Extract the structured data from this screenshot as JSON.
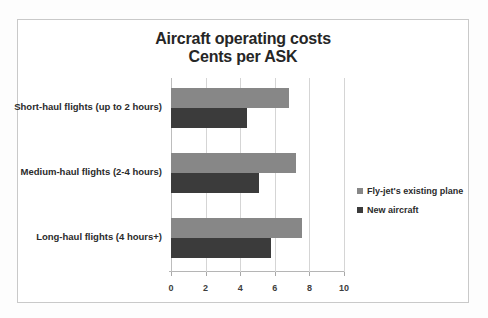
{
  "chart_data": {
    "type": "bar",
    "orientation": "horizontal",
    "title": "Aircraft operating costs",
    "subtitle": "Cents per ASK",
    "categories": [
      "Short-haul flights (up to 2 hours)",
      "Medium-haul flights (2-4 hours)",
      "Long-haul flights (4 hours+)"
    ],
    "series": [
      {
        "name": "Fly-jet's existing plane",
        "color": "#878787",
        "values": [
          6.8,
          7.2,
          7.6
        ]
      },
      {
        "name": "New aircraft",
        "color": "#3b3b3b",
        "values": [
          4.4,
          5.1,
          5.8
        ]
      }
    ],
    "xlabel": "",
    "ylabel": "",
    "xlim": [
      0,
      10
    ],
    "xticks": [
      0,
      2,
      4,
      6,
      8,
      10
    ],
    "xtick_labels": [
      "0",
      "2",
      "4",
      "6",
      "8",
      "10"
    ],
    "grid": true,
    "legend_position": "right"
  },
  "frame": {
    "border_color": "#c9c9c9",
    "background": "#ffffff"
  }
}
